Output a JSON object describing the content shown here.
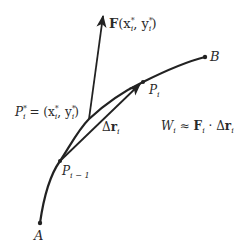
{
  "diagram": {
    "type": "line-integral-work-segment",
    "points": {
      "A": {
        "label": "A",
        "x": 40,
        "y": 223
      },
      "P_i_minus_1": {
        "label_main": "P",
        "label_sub": "i − 1",
        "x": 60,
        "y": 161
      },
      "P_i_star": {
        "label_main": "P",
        "label_sub": "i",
        "label_sup": "*",
        "x": 89,
        "y": 119
      },
      "P_i": {
        "label_main": "P",
        "label_sub": "i",
        "x": 143,
        "y": 82
      },
      "B": {
        "label": "B",
        "x": 205,
        "y": 57
      }
    },
    "vectors": {
      "force": {
        "label_bold": "F",
        "label_args": "(x",
        "label_sub1": "i",
        "label_sup1": "*",
        "label_mid": ", y",
        "label_sub2": "i",
        "label_sup2": "*",
        "label_close": ")"
      },
      "displacement": {
        "label_delta": "Δ",
        "label_bold": "r",
        "label_sub": "i"
      }
    },
    "point_eq": {
      "lhs_main": "P",
      "lhs_sub": "i",
      "lhs_sup": "*",
      "eq": " = (x",
      "sub1": "i",
      "sup1": "*",
      "mid": ", y",
      "sub2": "i",
      "sup2": "*",
      "close": ")"
    },
    "formula": {
      "W": "W",
      "W_sub": "i",
      "approx": " ≈ ",
      "F": "F",
      "F_sub": "i",
      "dot": " · Δ",
      "r": "r",
      "r_sub": "i"
    },
    "colors": {
      "stroke": "#222222",
      "text": "#2a2a2a"
    }
  }
}
